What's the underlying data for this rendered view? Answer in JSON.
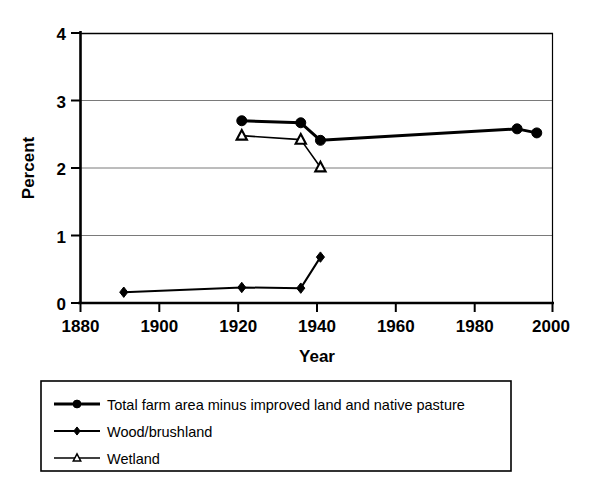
{
  "chart_data": {
    "type": "line",
    "title": "",
    "xlabel": "Year",
    "ylabel": "Percent",
    "xlim": [
      1880,
      2000
    ],
    "ylim": [
      0,
      4
    ],
    "xticks": [
      1880,
      1900,
      1920,
      1940,
      1960,
      1980,
      2000
    ],
    "yticks": [
      0,
      1,
      2,
      3,
      4
    ],
    "grid": "horizontal",
    "legend_position": "below-plot",
    "series": [
      {
        "name": "Total farm area minus improved land and native pasture",
        "marker": "filled-circle",
        "color": "#000000",
        "linewidth": 3,
        "x": [
          1921,
          1936,
          1941,
          1991,
          1996
        ],
        "y": [
          2.7,
          2.67,
          2.41,
          2.58,
          2.52
        ]
      },
      {
        "name": "Wood/brushland",
        "marker": "filled-diamond",
        "color": "#000000",
        "linewidth": 2,
        "x": [
          1891,
          1921,
          1936,
          1941
        ],
        "y": [
          0.16,
          0.23,
          0.22,
          0.68
        ]
      },
      {
        "name": "Wetland",
        "marker": "open-triangle",
        "color": "#000000",
        "linewidth": 1.6,
        "x": [
          1921,
          1936,
          1941
        ],
        "y": [
          2.48,
          2.42,
          2.01
        ]
      }
    ]
  },
  "axes": {
    "ylabel": "Percent",
    "xlabel": "Year",
    "ytick_labels": [
      "0",
      "1",
      "2",
      "3",
      "4"
    ],
    "xtick_labels": [
      "1880",
      "1900",
      "1920",
      "1940",
      "1960",
      "1980",
      "2000"
    ]
  },
  "legend": {
    "items": [
      {
        "label": "Total farm area minus improved land and native pasture",
        "marker": "filled-circle"
      },
      {
        "label": "Wood/brushland",
        "marker": "filled-diamond"
      },
      {
        "label": "Wetland",
        "marker": "open-triangle"
      }
    ]
  }
}
